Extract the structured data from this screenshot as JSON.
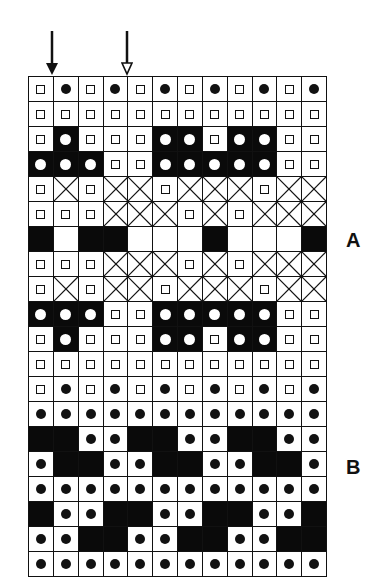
{
  "figure": {
    "columns": 12,
    "legend_cell_types": {
      "sq": "small open square",
      "dot": "black dot on white",
      "bw": "white dot on black",
      "x": "crossed cell",
      "b": "solid black",
      "w": "empty white"
    },
    "arrows": [
      {
        "name": "solid-arrow",
        "style": "filled",
        "col_boundary": 1
      },
      {
        "name": "hollow-arrow",
        "style": "hollow",
        "col_boundary": 4
      }
    ],
    "labels": [
      {
        "id": "A",
        "text": "A",
        "row": 7
      },
      {
        "id": "B",
        "text": "B",
        "row": 17
      }
    ],
    "rows": [
      [
        "sq",
        "dot",
        "sq",
        "dot",
        "sq",
        "dot",
        "sq",
        "dot",
        "sq",
        "dot",
        "sq",
        "dot"
      ],
      [
        "sq",
        "sq",
        "sq",
        "sq",
        "sq",
        "sq",
        "sq",
        "sq",
        "sq",
        "sq",
        "sq",
        "sq"
      ],
      [
        "sq",
        "bw",
        "sq",
        "sq",
        "sq",
        "bw",
        "bw",
        "sq",
        "bw",
        "bw",
        "sq",
        "sq"
      ],
      [
        "bw",
        "bw",
        "bw",
        "sq",
        "sq",
        "bw",
        "bw",
        "bw",
        "bw",
        "bw",
        "sq",
        "sq"
      ],
      [
        "sq",
        "x",
        "sq",
        "x",
        "x",
        "sq",
        "x",
        "x",
        "x",
        "sq",
        "x",
        "x"
      ],
      [
        "sq",
        "sq",
        "sq",
        "x",
        "x",
        "x",
        "sq",
        "x",
        "sq",
        "x",
        "x",
        "x"
      ],
      [
        "b",
        "w",
        "b",
        "b",
        "w",
        "w",
        "w",
        "b",
        "w",
        "w",
        "w",
        "b"
      ],
      [
        "sq",
        "sq",
        "sq",
        "x",
        "x",
        "x",
        "sq",
        "x",
        "sq",
        "x",
        "x",
        "x"
      ],
      [
        "sq",
        "x",
        "sq",
        "x",
        "x",
        "sq",
        "x",
        "x",
        "x",
        "sq",
        "x",
        "x"
      ],
      [
        "bw",
        "bw",
        "bw",
        "sq",
        "sq",
        "bw",
        "bw",
        "bw",
        "bw",
        "bw",
        "sq",
        "sq"
      ],
      [
        "sq",
        "bw",
        "sq",
        "sq",
        "sq",
        "bw",
        "bw",
        "sq",
        "bw",
        "bw",
        "sq",
        "sq"
      ],
      [
        "sq",
        "sq",
        "sq",
        "sq",
        "sq",
        "sq",
        "sq",
        "sq",
        "sq",
        "sq",
        "sq",
        "sq"
      ],
      [
        "sq",
        "dot",
        "sq",
        "dot",
        "sq",
        "dot",
        "sq",
        "dot",
        "sq",
        "dot",
        "sq",
        "dot"
      ],
      [
        "dot",
        "dot",
        "dot",
        "dot",
        "dot",
        "dot",
        "dot",
        "dot",
        "dot",
        "dot",
        "dot",
        "dot"
      ],
      [
        "b",
        "b",
        "dot",
        "dot",
        "b",
        "b",
        "dot",
        "dot",
        "b",
        "b",
        "dot",
        "dot"
      ],
      [
        "dot",
        "b",
        "b",
        "dot",
        "dot",
        "b",
        "b",
        "dot",
        "dot",
        "b",
        "b",
        "dot"
      ],
      [
        "dot",
        "dot",
        "dot",
        "dot",
        "dot",
        "dot",
        "dot",
        "dot",
        "dot",
        "dot",
        "dot",
        "dot"
      ],
      [
        "b",
        "dot",
        "dot",
        "b",
        "b",
        "dot",
        "dot",
        "b",
        "b",
        "dot",
        "dot",
        "b"
      ],
      [
        "dot",
        "dot",
        "b",
        "b",
        "dot",
        "dot",
        "b",
        "b",
        "dot",
        "dot",
        "b",
        "b"
      ],
      [
        "dot",
        "dot",
        "dot",
        "dot",
        "dot",
        "dot",
        "dot",
        "dot",
        "dot",
        "dot",
        "dot",
        "dot"
      ]
    ]
  }
}
